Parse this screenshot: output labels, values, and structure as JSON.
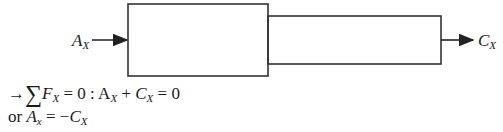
{
  "diagram": {
    "left_force": {
      "symbol": "A",
      "subscript": "X"
    },
    "right_force": {
      "symbol": "C",
      "subscript": "X"
    },
    "large_box": {
      "x": 128,
      "y": 4,
      "width": 140,
      "height": 72
    },
    "small_box": {
      "x": 268,
      "y": 16,
      "width": 173,
      "height": 48
    },
    "line_color": "#333333"
  },
  "equations": {
    "line1": {
      "arrow": "→",
      "sigma": "∑",
      "F": "F",
      "F_sub": "X",
      "eq_zero": " = 0 :",
      "A": " A",
      "A_sub": "X",
      "plus": " + ",
      "C": "C",
      "C_sub": "X",
      "rhs": " = 0"
    },
    "line2": {
      "or": "or ",
      "A": "A",
      "A_sub": "x",
      "eq": " = −",
      "C": "C",
      "C_sub": "X"
    }
  }
}
